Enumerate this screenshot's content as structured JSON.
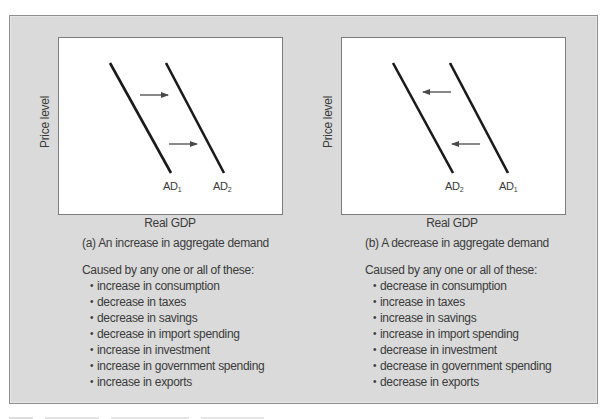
{
  "colors": {
    "panel_bg": "#dadada",
    "chart_bg": "#ffffff",
    "curve": "#1a1a1a",
    "arrow": "#4a4a4a",
    "text": "#3a3a3a"
  },
  "panel_a": {
    "y_axis_label": "Price level",
    "x_axis_label": "Real GDP",
    "curve_left": {
      "base": "AD",
      "sub": "1"
    },
    "curve_right": {
      "base": "AD",
      "sub": "2"
    },
    "shift_direction": "right",
    "caption": "(a) An increase in aggregate demand",
    "causes_heading": "Caused by any one or all of these:",
    "causes": [
      "increase in consumption",
      "decrease in taxes",
      "decrease in savings",
      "decrease in import spending",
      "increase in investment",
      "increase in government spending",
      "increase in exports"
    ]
  },
  "panel_b": {
    "y_axis_label": "Price level",
    "x_axis_label": "Real GDP",
    "curve_left": {
      "base": "AD",
      "sub": "2"
    },
    "curve_right": {
      "base": "AD",
      "sub": "1"
    },
    "shift_direction": "left",
    "caption": "(b) A decrease in aggregate demand",
    "causes_heading": "Caused by any one or all of these:",
    "causes": [
      "decrease in consumption",
      "increase in taxes",
      "increase in savings",
      "increase in import spending",
      "decrease in investment",
      "decrease in government spending",
      "decrease in exports"
    ]
  },
  "bullet_glyph": "•"
}
